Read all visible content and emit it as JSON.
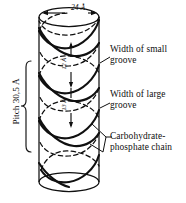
{
  "figure": {
    "ink_color": "#101010",
    "background_color": "#ffffff"
  },
  "dimensions": {
    "diameter_label": "24 Å",
    "pitch_label": "Pitch 30,5 Å",
    "small_groove_value": "12 Å",
    "large_groove_value": "13 Å"
  },
  "callouts": {
    "small_groove": {
      "line1": "Width of small",
      "line2": "groove"
    },
    "large_groove": {
      "line1": "Width of large",
      "line2": "groove"
    },
    "chain": {
      "line1": "Carbohydrate-",
      "line2": "phosphate chain"
    }
  },
  "icons": {
    "cylinder": "cylinder-icon",
    "helix_front": "helix-strand-front-icon",
    "helix_back": "helix-strand-back-icon",
    "diameter_arrow": "double-arrow-icon",
    "pitch_brace": "brace-icon",
    "leader_line": "leader-line-icon"
  }
}
